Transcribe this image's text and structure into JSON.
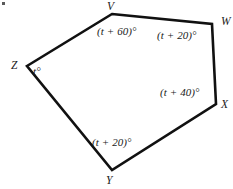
{
  "figure": {
    "type": "polygon-angle-diagram",
    "shape_name": "pentagon VWXYZ",
    "stroke_color": "#111111",
    "background_color": "#ffffff",
    "speck_label": "scan-speck",
    "vertices": [
      {
        "id": "V",
        "label": "V",
        "x": 112,
        "y": 14
      },
      {
        "id": "W",
        "label": "W",
        "x": 212,
        "y": 24
      },
      {
        "id": "X",
        "label": "X",
        "x": 216,
        "y": 104
      },
      {
        "id": "Y",
        "label": "Y",
        "x": 112,
        "y": 170
      },
      {
        "id": "Z",
        "label": "Z",
        "x": 27,
        "y": 66
      }
    ],
    "angles": [
      {
        "at": "V",
        "label": "(t + 60)°"
      },
      {
        "at": "W",
        "label": "(t + 20)°"
      },
      {
        "at": "X",
        "label": "(t + 40)°"
      },
      {
        "at": "Y",
        "label": "(t + 20)°"
      },
      {
        "at": "Z",
        "label": "t°"
      }
    ]
  }
}
